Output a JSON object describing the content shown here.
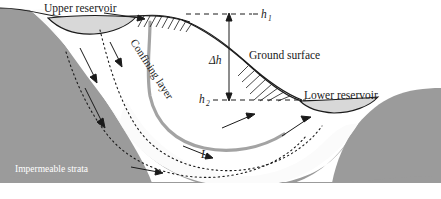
{
  "figure": {
    "width": 441,
    "height": 199
  },
  "labels": {
    "upper_reservoir": "Upper reservoir",
    "lower_reservoir": "Lower reservoir",
    "ground_surface": "Ground surface",
    "confining_layer": "Confining layer",
    "impermeable_strata": "Impermeable strata",
    "h1": "h",
    "h1_sub": "1",
    "delta_h": "Δh",
    "h2": "h",
    "h2_sub": "2",
    "length": "L"
  },
  "colors": {
    "strata_gray": "#9b9b9b",
    "confining_layer_gray": "#a3a3a3",
    "reservoir_fill": "#d8d8d8",
    "aquifer_fill": "#fbfbfb",
    "outline": "#1a1a1a",
    "white_text": "#ffffff",
    "background": "#ffffff",
    "footer_band": "#f2f2f2"
  },
  "annotations": {
    "flow_arrow_count": 5,
    "flow_direction": "from upper reservoir down through confining aquifer to lower reservoir",
    "dashed_datum_top": "horizontal dashed datum line at h1 elevation",
    "dashed_datum_bottom": "horizontal dashed datum line at h2 elevation",
    "hatching_top": "water table hatching on hill crest",
    "hatching_right": "seepage face hatching above lower reservoir",
    "head_difference_arrow": "double-headed vertical arrow labelled delta h between h1 and h2"
  }
}
